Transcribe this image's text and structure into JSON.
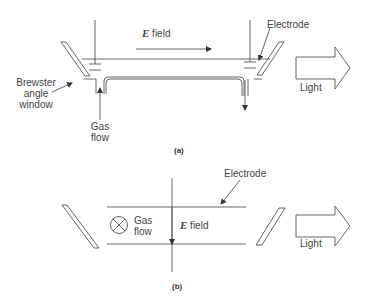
{
  "panel_a": {
    "field_symbol": "E",
    "field_label": " field",
    "electrode_label": "Electrode",
    "window_label_lines": [
      "Brewster",
      "angle",
      "window"
    ],
    "gas_label_lines": [
      "Gas",
      "flow"
    ],
    "light_label": "Light",
    "caption": "(a)"
  },
  "panel_b": {
    "electrode_label": "Electrode",
    "gas_label_lines": [
      "Gas",
      "flow"
    ],
    "field_symbol": "E",
    "field_label": " field",
    "light_label": "Light",
    "caption": "(b)"
  },
  "colors": {
    "line": "#555555",
    "text": "#444444"
  }
}
